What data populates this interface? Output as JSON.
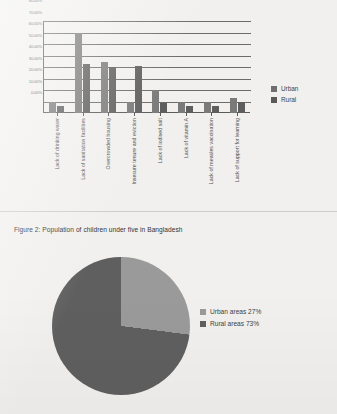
{
  "chart_data": [
    {
      "type": "bar",
      "title": "",
      "xlabel": "",
      "ylabel": "",
      "ylim": [
        0,
        80
      ],
      "grid": true,
      "legend_position": "right",
      "ytick_labels": [
        "80.00%",
        "70.00%",
        "60.00%",
        "50.00%",
        "40.00%",
        "30.00%",
        "20.00%",
        "10.00%",
        "0.00%"
      ],
      "ytick_values": [
        80,
        70,
        60,
        50,
        40,
        30,
        20,
        10,
        0
      ],
      "categories": [
        "Lack of drinking water",
        "Lack of sanitation facilities",
        "Overcrowded housing",
        "Insecure tenure and eviction",
        "Lack of iodised salt",
        "Lack of vitamin A",
        "Lack of measles vaccination",
        "Lack of support for learning"
      ],
      "series": [
        {
          "name": "Urban",
          "color": "#7a7a7a",
          "values": [
            10,
            70,
            44,
            10,
            20,
            10,
            10,
            13
          ]
        },
        {
          "name": "Rural",
          "color": "#5e5e5e",
          "values": [
            6,
            43,
            40,
            41,
            8.5,
            6.5,
            6.5,
            9.5
          ]
        }
      ]
    },
    {
      "type": "pie",
      "title": "Figure 2: Population of children under five in Bangladesh",
      "legend_position": "right",
      "labels": [
        "Urban areas 27%",
        "Rural areas 73%"
      ],
      "slice_names": [
        "Urban areas",
        "Rural areas"
      ],
      "values": [
        27,
        73
      ],
      "colors": [
        "#9a9a9a",
        "#5f5f5f"
      ]
    }
  ],
  "bar_chart": {
    "legend": [
      {
        "label": "Urban"
      },
      {
        "label": "Rural"
      }
    ]
  },
  "figure2": {
    "caption": "Figure 2: Population of children under five in Bangladesh",
    "legend": [
      {
        "label": "Urban areas 27%"
      },
      {
        "label": "Rural areas 73%"
      }
    ]
  }
}
